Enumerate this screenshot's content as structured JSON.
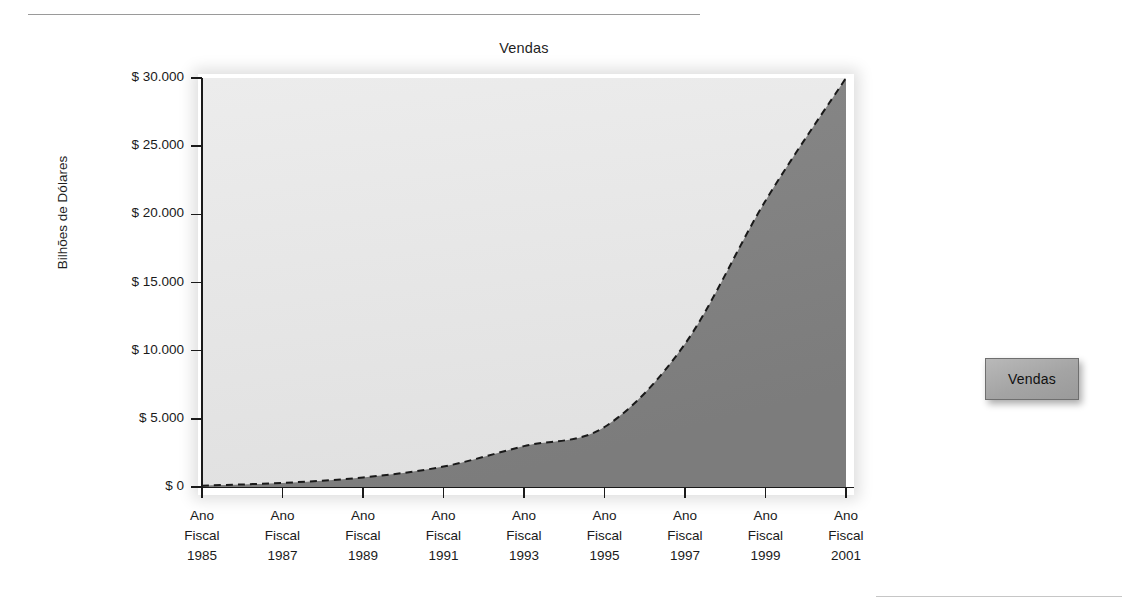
{
  "chart_data": {
    "type": "area",
    "title": "Vendas",
    "xlabel": "",
    "ylabel": "Bilhões de Dólares",
    "grid": false,
    "legend_position": "right",
    "legend": [
      "Vendas"
    ],
    "series_style": "dashed-line-with-shaded-area",
    "categories": [
      "Ano Fiscal 1985",
      "Ano Fiscal 1987",
      "Ano Fiscal 1989",
      "Ano Fiscal 1991",
      "Ano Fiscal 1993",
      "Ano Fiscal 1995",
      "Ano Fiscal 1997",
      "Ano Fiscal 1999",
      "Ano Fiscal 2001"
    ],
    "x_tick_lines": [
      [
        "Ano",
        "Fiscal",
        "1985"
      ],
      [
        "Ano",
        "Fiscal",
        "1987"
      ],
      [
        "Ano",
        "Fiscal",
        "1989"
      ],
      [
        "Ano",
        "Fiscal",
        "1991"
      ],
      [
        "Ano",
        "Fiscal",
        "1993"
      ],
      [
        "Ano",
        "Fiscal",
        "1995"
      ],
      [
        "Ano",
        "Fiscal",
        "1997"
      ],
      [
        "Ano",
        "Fiscal",
        "1999"
      ],
      [
        "Ano",
        "Fiscal",
        "2001"
      ]
    ],
    "series": [
      {
        "name": "Vendas",
        "values": [
          100,
          300,
          700,
          1500,
          3000,
          4400,
          10500,
          21000,
          30000
        ]
      }
    ],
    "ylim": [
      0,
      30000
    ],
    "y_ticks": [
      0,
      5000,
      10000,
      15000,
      20000,
      25000,
      30000
    ],
    "y_tick_labels": [
      "$ 0",
      "$ 5.000",
      "$ 10.000",
      "$ 15.000",
      "$ 20.000",
      "$ 25.000",
      "$ 30.000"
    ],
    "colors": {
      "area_below_curve": "#808080",
      "area_above_curve": "#e6e6e6",
      "curve": "#1a1a1a",
      "axis": "#1a1a1a",
      "legend_fill": "#a8a8a8",
      "legend_border": "#6f6f6f"
    }
  },
  "legend": {
    "label": "Vendas"
  }
}
